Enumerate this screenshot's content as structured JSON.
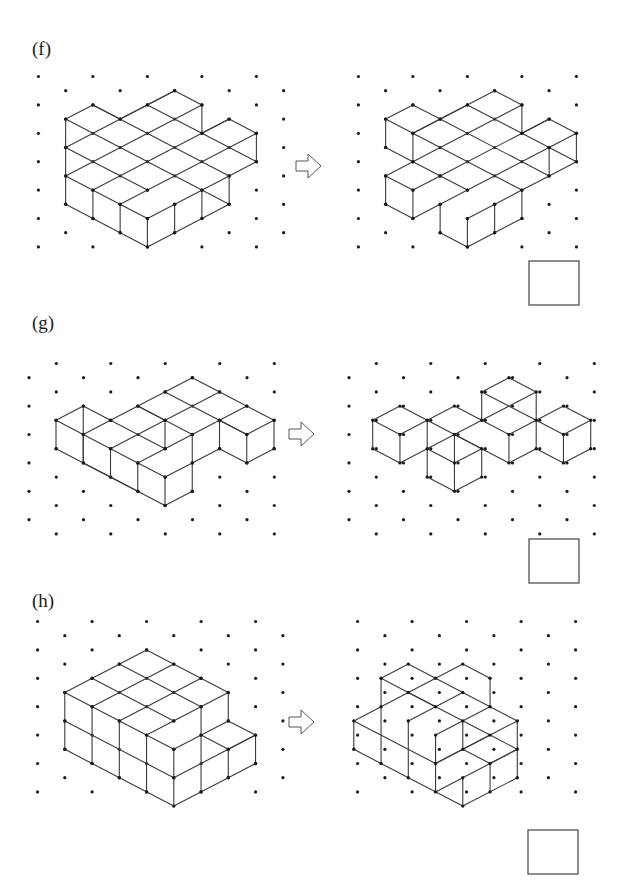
{
  "exercises": [
    {
      "label": "(f)",
      "label_pos": [
        32,
        38
      ],
      "grid": {
        "x0": 38.4,
        "y0": 76.5,
        "dx": 27.25,
        "dy": 14.2,
        "cols": 17,
        "rows": 12,
        "skip_cols": [
          10
        ],
        "parity": 0,
        "dot_limit_right": 280
      },
      "left": {
        "origin": [
          38.4,
          76.5
        ],
        "segments": [
          [
            1,
            3,
            2,
            2
          ],
          [
            2,
            2,
            3,
            3
          ],
          [
            3,
            3,
            5,
            1
          ],
          [
            5,
            1,
            6,
            2
          ],
          [
            6,
            2,
            6,
            4
          ],
          [
            6,
            4,
            7,
            3
          ],
          [
            7,
            3,
            8,
            4
          ],
          [
            8,
            4,
            8,
            6
          ],
          [
            8,
            6,
            7,
            7
          ],
          [
            7,
            7,
            7,
            9
          ],
          [
            7,
            9,
            4,
            12
          ],
          [
            4,
            12,
            1,
            9
          ],
          [
            1,
            9,
            1,
            3
          ],
          [
            1,
            3,
            7,
            9
          ],
          [
            2,
            2,
            7,
            7
          ],
          [
            4,
            2,
            6,
            4
          ],
          [
            6,
            4,
            8,
            6
          ],
          [
            1,
            5,
            5,
            1
          ],
          [
            1,
            7,
            6,
            2
          ],
          [
            2,
            8,
            7,
            3
          ],
          [
            3,
            9,
            8,
            4
          ],
          [
            4,
            10,
            7,
            7
          ],
          [
            1,
            5,
            4,
            8
          ],
          [
            1,
            7,
            4,
            10
          ],
          [
            2,
            8,
            2,
            10
          ],
          [
            3,
            9,
            3,
            11
          ],
          [
            4,
            10,
            4,
            12
          ],
          [
            5,
            9,
            5,
            11
          ],
          [
            6,
            8,
            6,
            10
          ]
        ]
      },
      "right": {
        "origin": [
          358.4,
          76.5
        ],
        "segments": [
          [
            1,
            3,
            2,
            2
          ],
          [
            2,
            2,
            3,
            3
          ],
          [
            3,
            3,
            5,
            1
          ],
          [
            5,
            1,
            6,
            2
          ],
          [
            6,
            2,
            6,
            4
          ],
          [
            6,
            4,
            7,
            3
          ],
          [
            7,
            3,
            8,
            4
          ],
          [
            8,
            4,
            8,
            6
          ],
          [
            8,
            6,
            7,
            7
          ],
          [
            7,
            7,
            6,
            8
          ],
          [
            6,
            8,
            6,
            10
          ],
          [
            6,
            10,
            4,
            12
          ],
          [
            4,
            12,
            3,
            11
          ],
          [
            3,
            11,
            3,
            9
          ],
          [
            3,
            9,
            2,
            10
          ],
          [
            2,
            10,
            1,
            9
          ],
          [
            1,
            9,
            1,
            7
          ],
          [
            1,
            7,
            2,
            6
          ],
          [
            2,
            6,
            1,
            5
          ],
          [
            1,
            5,
            1,
            3
          ],
          [
            1,
            3,
            2,
            4
          ],
          [
            2,
            4,
            2,
            6
          ],
          [
            2,
            4,
            3,
            3
          ],
          [
            3,
            3,
            7,
            7
          ],
          [
            4,
            2,
            6,
            4
          ],
          [
            6,
            4,
            8,
            6
          ],
          [
            2,
            4,
            6,
            8
          ],
          [
            2,
            6,
            4,
            8
          ],
          [
            2,
            4,
            4,
            2
          ],
          [
            2,
            6,
            6,
            2
          ],
          [
            3,
            7,
            7,
            3
          ],
          [
            3,
            9,
            8,
            4
          ],
          [
            4,
            10,
            6,
            8
          ],
          [
            1,
            7,
            2,
            8
          ],
          [
            2,
            8,
            2,
            10
          ],
          [
            2,
            8,
            3,
            7
          ],
          [
            4,
            10,
            4,
            12
          ],
          [
            5,
            9,
            5,
            11
          ],
          [
            7,
            5,
            7,
            7
          ]
        ]
      },
      "answer_box": {
        "x": 529,
        "y": 261,
        "w": 50,
        "h": 44
      }
    },
    {
      "label": "(g)",
      "label_pos": [
        32,
        333
      ],
      "grid": {
        "x0": 29,
        "y0": 363.5,
        "dx": 27.25,
        "dy": 14.2,
        "cols": 22,
        "rows": 12,
        "skip_cols": [
          11
        ],
        "parity": 1,
        "dot_limit_right": 315
      },
      "left": {
        "origin": [
          56,
          377.7
        ],
        "segments": [
          [
            0,
            3,
            1,
            2
          ],
          [
            1,
            2,
            2,
            3
          ],
          [
            2,
            3,
            5,
            0
          ],
          [
            5,
            0,
            8,
            3
          ],
          [
            8,
            3,
            7,
            4
          ],
          [
            7,
            4,
            6,
            3
          ],
          [
            8,
            3,
            8,
            5
          ],
          [
            8,
            5,
            7,
            6
          ],
          [
            7,
            6,
            7,
            4
          ],
          [
            7,
            6,
            6,
            5
          ],
          [
            6,
            5,
            5,
            6
          ],
          [
            6,
            5,
            6,
            3
          ],
          [
            0,
            3,
            0,
            5
          ],
          [
            0,
            5,
            4,
            9
          ],
          [
            4,
            9,
            5,
            8
          ],
          [
            5,
            8,
            5,
            4
          ],
          [
            0,
            3,
            3,
            6
          ],
          [
            1,
            2,
            1,
            6
          ],
          [
            1,
            4,
            2,
            3
          ],
          [
            1,
            4,
            1,
            6
          ],
          [
            2,
            3,
            4,
            5
          ],
          [
            3,
            6,
            5,
            4
          ],
          [
            5,
            4,
            6,
            3
          ],
          [
            6,
            3,
            7,
            2
          ],
          [
            4,
            1,
            7,
            4
          ],
          [
            3,
            2,
            5,
            4
          ],
          [
            2,
            5,
            2,
            7
          ],
          [
            2,
            5,
            4,
            3
          ],
          [
            4,
            3,
            6,
            1
          ],
          [
            4,
            3,
            4,
            5
          ],
          [
            1,
            6,
            2,
            7
          ],
          [
            2,
            7,
            3,
            8
          ],
          [
            3,
            6,
            3,
            8
          ],
          [
            3,
            6,
            4,
            7
          ],
          [
            4,
            7,
            5,
            6
          ],
          [
            4,
            7,
            4,
            9
          ],
          [
            3,
            2,
            4,
            3
          ]
        ]
      },
      "right": {
        "origin": [
          372.7,
          377.7
        ],
        "segments": [
          [
            0,
            3,
            1,
            2
          ],
          [
            1,
            2,
            2,
            3
          ],
          [
            2,
            3,
            3,
            2
          ],
          [
            3,
            2,
            4,
            3
          ],
          [
            4,
            3,
            4,
            1
          ],
          [
            4,
            1,
            5,
            0
          ],
          [
            5,
            0,
            6,
            1
          ],
          [
            6,
            1,
            6,
            3
          ],
          [
            6,
            3,
            7,
            2
          ],
          [
            7,
            2,
            8,
            3
          ],
          [
            8,
            3,
            8,
            5
          ],
          [
            8,
            5,
            7,
            6
          ],
          [
            7,
            6,
            6,
            5
          ],
          [
            6,
            5,
            5,
            6
          ],
          [
            5,
            6,
            4,
            5
          ],
          [
            4,
            5,
            4,
            7
          ],
          [
            4,
            7,
            3,
            8
          ],
          [
            3,
            8,
            2,
            7
          ],
          [
            2,
            7,
            2,
            5
          ],
          [
            2,
            5,
            1,
            6
          ],
          [
            1,
            6,
            0,
            5
          ],
          [
            0,
            5,
            0,
            3
          ],
          [
            0,
            3,
            1,
            4
          ],
          [
            1,
            4,
            2,
            3
          ],
          [
            1,
            4,
            1,
            6
          ],
          [
            2,
            3,
            2,
            5
          ],
          [
            2,
            3,
            4,
            5
          ],
          [
            2,
            5,
            4,
            3
          ],
          [
            3,
            4,
            3,
            6
          ],
          [
            3,
            4,
            4,
            5
          ],
          [
            2,
            5,
            3,
            6
          ],
          [
            3,
            6,
            4,
            5
          ],
          [
            3,
            6,
            3,
            8
          ],
          [
            4,
            1,
            6,
            3
          ],
          [
            4,
            3,
            6,
            1
          ],
          [
            4,
            3,
            5,
            4
          ],
          [
            5,
            4,
            6,
            3
          ],
          [
            5,
            4,
            5,
            6
          ],
          [
            6,
            3,
            6,
            5
          ],
          [
            6,
            3,
            7,
            4
          ],
          [
            7,
            4,
            8,
            3
          ],
          [
            7,
            4,
            7,
            6
          ]
        ]
      },
      "answer_box": {
        "x": 529,
        "y": 539,
        "w": 50,
        "h": 44
      }
    },
    {
      "label": "(h)",
      "label_pos": [
        32,
        620
      ],
      "grid": {
        "x0": 37.6,
        "y0": 621.5,
        "dx": 27.25,
        "dy": 14.2,
        "cols": 20,
        "rows": 12,
        "skip_cols": [
          10
        ],
        "parity": 0,
        "dot_limit_right": 285
      },
      "left": {
        "origin": [
          64.8,
          649.9
        ],
        "segments": [
          [
            0,
            3,
            3,
            0
          ],
          [
            3,
            0,
            6,
            3
          ],
          [
            6,
            3,
            6,
            5
          ],
          [
            6,
            5,
            7,
            6
          ],
          [
            7,
            6,
            7,
            8
          ],
          [
            7,
            8,
            6,
            9
          ],
          [
            6,
            9,
            4,
            11
          ],
          [
            4,
            11,
            0,
            7
          ],
          [
            0,
            7,
            0,
            3
          ],
          [
            2,
            1,
            5,
            4
          ],
          [
            1,
            2,
            4,
            5
          ],
          [
            0,
            3,
            4,
            7
          ],
          [
            1,
            4,
            4,
            1
          ],
          [
            2,
            5,
            5,
            2
          ],
          [
            3,
            6,
            6,
            3
          ],
          [
            4,
            7,
            6,
            5
          ],
          [
            0,
            5,
            4,
            9
          ],
          [
            4,
            9,
            7,
            6
          ],
          [
            5,
            6,
            6,
            7
          ],
          [
            6,
            7,
            7,
            6
          ],
          [
            4,
            7,
            4,
            11
          ],
          [
            5,
            4,
            5,
            10
          ],
          [
            6,
            7,
            6,
            9
          ],
          [
            3,
            6,
            3,
            10
          ],
          [
            2,
            5,
            2,
            9
          ],
          [
            1,
            4,
            1,
            8
          ]
        ]
      },
      "right": {
        "origin": [
          353.8,
          664.1
        ],
        "segments": [
          [
            1,
            1,
            2,
            0
          ],
          [
            2,
            0,
            3,
            1
          ],
          [
            3,
            1,
            4,
            0
          ],
          [
            4,
            0,
            5,
            1
          ],
          [
            5,
            1,
            5,
            3
          ],
          [
            5,
            3,
            6,
            4
          ],
          [
            6,
            4,
            6,
            8
          ],
          [
            6,
            8,
            4,
            10
          ],
          [
            4,
            10,
            0,
            6
          ],
          [
            0,
            6,
            0,
            4
          ],
          [
            0,
            4,
            1,
            3
          ],
          [
            1,
            3,
            1,
            1
          ],
          [
            1,
            1,
            3,
            3
          ],
          [
            2,
            2,
            5,
            5
          ],
          [
            3,
            1,
            5,
            3
          ],
          [
            1,
            3,
            3,
            1
          ],
          [
            2,
            4,
            4,
            2
          ],
          [
            3,
            5,
            5,
            3
          ],
          [
            0,
            4,
            3,
            7
          ],
          [
            1,
            3,
            1,
            7
          ],
          [
            2,
            4,
            2,
            8
          ],
          [
            3,
            5,
            3,
            9
          ],
          [
            3,
            7,
            6,
            4
          ],
          [
            3,
            7,
            4,
            6
          ],
          [
            4,
            6,
            5,
            5
          ],
          [
            4,
            6,
            5,
            7
          ],
          [
            5,
            7,
            6,
            6
          ],
          [
            5,
            5,
            6,
            6
          ],
          [
            5,
            7,
            5,
            9
          ],
          [
            3,
            9,
            4,
            8
          ],
          [
            4,
            8,
            6,
            6
          ],
          [
            4,
            8,
            4,
            10
          ],
          [
            4,
            4,
            4,
            6
          ]
        ]
      },
      "answer_box": {
        "x": 528,
        "y": 830,
        "w": 50,
        "h": 44
      }
    }
  ],
  "arrows": [
    {
      "x": 296,
      "y": 166
    },
    {
      "x": 289,
      "y": 434
    },
    {
      "x": 289,
      "y": 722
    }
  ],
  "style": {
    "line_color": "#3a3a3a",
    "dot_color": "#1a1a1a",
    "box_color": "#444444"
  }
}
